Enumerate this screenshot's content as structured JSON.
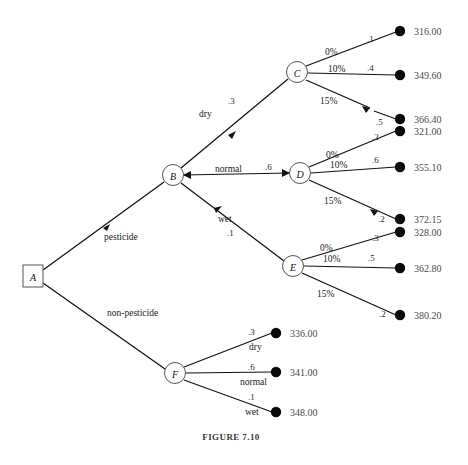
{
  "figure": {
    "caption": "FIGURE 7.10",
    "colors": {
      "edge": "#111111",
      "terminal_dot": "#0a0a0a",
      "node_stroke": "#555555",
      "payoff_text": "#4a4a4a",
      "background": "#ffffff"
    }
  },
  "nodes": {
    "a": {
      "label": "A",
      "shape": "square",
      "x": 34,
      "y": 276
    },
    "b": {
      "label": "B",
      "shape": "circle",
      "x": 173,
      "y": 175
    },
    "c": {
      "label": "C",
      "shape": "circle",
      "x": 297,
      "y": 72
    },
    "d": {
      "label": "D",
      "shape": "circle",
      "x": 300,
      "y": 173
    },
    "e": {
      "label": "E",
      "shape": "circle",
      "x": 293,
      "y": 266
    },
    "f": {
      "label": "F",
      "shape": "circle",
      "x": 175,
      "y": 373
    }
  },
  "decisions": [
    {
      "label": "pesticide",
      "from": "A",
      "to": "B"
    },
    {
      "label": "non-pesticide",
      "from": "A",
      "to": "F"
    }
  ],
  "weather_branches": [
    {
      "label": "dry",
      "prob": ".3",
      "from": "B",
      "to": "C"
    },
    {
      "label": "normal",
      "prob": ".6",
      "from": "B",
      "to": "D"
    },
    {
      "label": "wet",
      "prob": ".1",
      "from": "B",
      "to": "E"
    }
  ],
  "outcome_groups": [
    {
      "node": "C",
      "weather": "dry",
      "outcomes": [
        {
          "pct": "0%",
          "prob": ".1",
          "payoff": "316.00"
        },
        {
          "pct": "10%",
          "prob": ".4",
          "payoff": "349.60"
        },
        {
          "pct": "15%",
          "prob": ".5",
          "payoff": "366.40"
        }
      ]
    },
    {
      "node": "D",
      "weather": "normal",
      "outcomes": [
        {
          "pct": "0%",
          "prob": ".2",
          "payoff": "321.00"
        },
        {
          "pct": "10%",
          "prob": ".6",
          "payoff": "355.10"
        },
        {
          "pct": "15%",
          "prob": ".2",
          "payoff": "372.15"
        }
      ]
    },
    {
      "node": "E",
      "weather": "wet",
      "outcomes": [
        {
          "pct": "0%",
          "prob": ".3",
          "payoff": "328.00"
        },
        {
          "pct": "10%",
          "prob": ".5",
          "payoff": "362.80"
        },
        {
          "pct": "15%",
          "prob": ".2",
          "payoff": "380.20"
        }
      ]
    }
  ],
  "nonpesticide_group": {
    "node": "F",
    "outcomes": [
      {
        "label": "dry",
        "prob": ".3",
        "payoff": "336.00"
      },
      {
        "label": "normal",
        "prob": ".6",
        "payoff": "341.00"
      },
      {
        "label": "wet",
        "prob": ".1",
        "payoff": "348.00"
      }
    ]
  }
}
